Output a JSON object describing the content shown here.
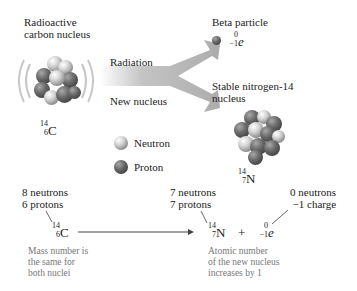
{
  "top": {
    "reactant_title_line1": "Radioactive",
    "reactant_title_line2": "carbon nucleus",
    "arrow_upper_label": "Radiation",
    "arrow_lower_label": "New nucleus",
    "beta_title": "Beta particle",
    "beta_symbol": {
      "mass": "0",
      "charge": "−1",
      "symbol": "e"
    },
    "product_title_line1": "Stable nitrogen-14",
    "product_title_line2": "nucleus",
    "carbon_symbol": {
      "mass": "14",
      "atomic": "6",
      "symbol": "C"
    },
    "nitrogen_symbol": {
      "mass": "14",
      "atomic": "7",
      "symbol": "N"
    }
  },
  "legend": {
    "items": [
      {
        "label": "Neutron",
        "icon": "neutron-sphere"
      },
      {
        "label": "Proton",
        "icon": "proton-sphere"
      }
    ]
  },
  "equation": {
    "carbon": {
      "line1": "8 neutrons",
      "line2": "6 protons",
      "mass": "14",
      "atomic": "6",
      "symbol": "C"
    },
    "nitrogen": {
      "line1": "7 neutrons",
      "line2": "7 protons",
      "mass": "14",
      "atomic": "7",
      "symbol": "N"
    },
    "plus": "+",
    "electron": {
      "line1": "0 neutrons",
      "line2": "−1 charge",
      "mass": "0",
      "atomic": "−1",
      "symbol": "e"
    },
    "note_left_line1": "Mass number is",
    "note_left_line2": "the same for",
    "note_left_line3": "both nuclei",
    "note_right_line1": "Atomic number",
    "note_right_line2": "of the new nucleus",
    "note_right_line3": "increases by 1"
  },
  "colors": {
    "neutron": "#cfcfcf",
    "proton": "#555555",
    "arrow": "#b5b5b5",
    "note_text": "#777777"
  }
}
